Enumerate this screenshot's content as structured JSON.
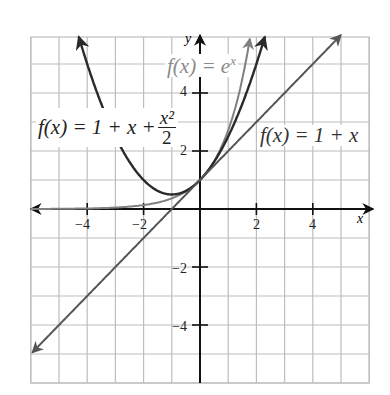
{
  "chart_data": {
    "type": "line",
    "title": "",
    "xlabel": "x",
    "ylabel": "y",
    "xlim": [
      -6,
      6
    ],
    "ylim": [
      -6,
      6
    ],
    "grid": true,
    "grid_step": 1,
    "x_ticks": [
      -4,
      -2,
      2,
      4
    ],
    "y_ticks": [
      4,
      2,
      -2,
      -4
    ],
    "x_tick_labels": [
      "−4",
      "−2",
      "2",
      "4"
    ],
    "y_tick_labels": [
      "4",
      "2",
      "−2",
      "−4"
    ],
    "series": [
      {
        "name": "f(x) = e^x",
        "function": "exp(x)",
        "color": "#808080",
        "x": [
          -6,
          -4,
          -2,
          -1,
          0,
          1,
          1.5,
          1.77
        ],
        "values": [
          0.0025,
          0.018,
          0.135,
          0.368,
          1,
          2.718,
          4.48,
          5.87
        ]
      },
      {
        "name": "f(x) = 1 + x + x^2/2",
        "function": "1+x+x^2/2",
        "color": "#2a2a2a",
        "x": [
          -4.3,
          -4,
          -2,
          -1,
          0,
          1,
          2,
          2.3
        ],
        "values": [
          5.95,
          5,
          1,
          0.5,
          1,
          2.5,
          5,
          5.95
        ]
      },
      {
        "name": "f(x) = 1 + x",
        "function": "1+x",
        "color": "#555555",
        "x": [
          -6,
          -4,
          -2,
          0,
          2,
          4,
          5
        ],
        "values": [
          -5,
          -3,
          -1,
          1,
          3,
          5,
          6
        ]
      }
    ],
    "annotations": [
      {
        "text": "f(x) = e^x",
        "near": [
          -1.2,
          5
        ]
      },
      {
        "text": "f(x) = 1 + x + x^2/2",
        "near": [
          -5.5,
          2.8
        ]
      },
      {
        "text": "f(x) = 1 + x",
        "near": [
          3.8,
          2.6
        ]
      }
    ]
  },
  "labels": {
    "x_axis": "x",
    "y_axis": "y",
    "ticks_x": [
      "−4",
      "−2",
      "2",
      "4"
    ],
    "ticks_y": [
      "4",
      "2",
      "−2",
      "−4"
    ],
    "exp_label_prefix": "f(x) = e",
    "exp_label_sup": "x",
    "quad_label_prefix": "f(x) = 1 + x + ",
    "quad_label_num": "x²",
    "quad_label_den": "2",
    "lin_label": "f(x) = 1 + x"
  }
}
